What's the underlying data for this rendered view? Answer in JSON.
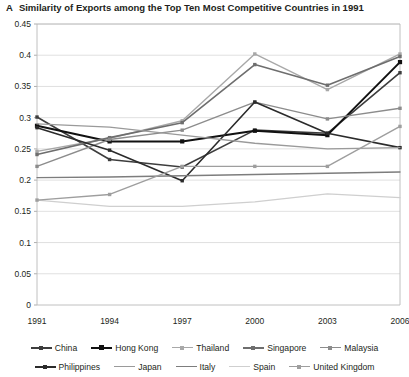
{
  "panel": {
    "letter": "A"
  },
  "title": "Similarity of Exports among the Top Ten Most Competitive Countries in 1991",
  "chart_data": {
    "type": "line",
    "title": "Similarity of Exports among the Top Ten Most Competitive Countries in 1991",
    "xlabel": "",
    "ylabel": "",
    "x": [
      "1991",
      "1994",
      "1997",
      "2000",
      "2003",
      "2006"
    ],
    "xticklabels": [
      "1991",
      "1994",
      "1997",
      "2000",
      "2003",
      "2006"
    ],
    "yticklabels": [
      "0",
      "0.05",
      "0.1",
      "0.15",
      "0.2",
      "0.25",
      "0.3",
      "0.35",
      "0.4",
      "0.45"
    ],
    "ylim": [
      0,
      0.45
    ],
    "ytick_step": 0.05,
    "grid": "horizontal",
    "legend_position": "bottom",
    "marker": "square-small",
    "series": [
      {
        "name": "China",
        "color": "#3d3d3d",
        "width": 1.6,
        "marker": true,
        "values": [
          0.301,
          0.233,
          0.221,
          0.28,
          0.275,
          0.372
        ]
      },
      {
        "name": "Hong Kong",
        "color": "#111111",
        "width": 2.0,
        "marker": true,
        "values": [
          0.287,
          0.262,
          0.262,
          0.279,
          0.272,
          0.389
        ]
      },
      {
        "name": "Thailand",
        "color": "#a8a8a8",
        "width": 1.4,
        "marker": true,
        "values": [
          0.246,
          0.267,
          0.295,
          0.402,
          0.345,
          0.402
        ]
      },
      {
        "name": "Singapore",
        "color": "#6e6e6e",
        "width": 1.6,
        "marker": true,
        "values": [
          0.241,
          0.268,
          0.292,
          0.385,
          0.352,
          0.398
        ]
      },
      {
        "name": "Malaysia",
        "color": "#8c8c8c",
        "width": 1.4,
        "marker": true,
        "values": [
          0.222,
          0.265,
          0.28,
          0.325,
          0.298,
          0.315
        ]
      },
      {
        "name": "Philippines",
        "color": "#2b2b2b",
        "width": 1.6,
        "marker": true,
        "values": [
          0.284,
          0.248,
          0.199,
          0.325,
          0.275,
          0.252
        ]
      },
      {
        "name": "Japan",
        "color": "#9a9a9a",
        "width": 1.3,
        "marker": false,
        "values": [
          0.29,
          0.285,
          0.272,
          0.259,
          0.25,
          0.252
        ]
      },
      {
        "name": "Italy",
        "color": "#7d7d7d",
        "width": 1.3,
        "marker": false,
        "values": [
          0.204,
          0.205,
          0.207,
          0.209,
          0.211,
          0.213
        ]
      },
      {
        "name": "Spain",
        "color": "#cfcfcf",
        "width": 1.3,
        "marker": false,
        "values": [
          0.168,
          0.158,
          0.158,
          0.165,
          0.178,
          0.172
        ]
      },
      {
        "name": "United Kingdom",
        "color": "#9e9e9e",
        "width": 1.4,
        "marker": true,
        "values": [
          0.168,
          0.177,
          0.222,
          0.222,
          0.222,
          0.286
        ]
      }
    ]
  },
  "legend": {
    "row1": [
      "China",
      "Hong Kong",
      "Thailand",
      "Singapore",
      "Malaysia"
    ],
    "row2": [
      "Philippines",
      "Japan",
      "Italy",
      "Spain",
      "United Kingdom"
    ]
  }
}
